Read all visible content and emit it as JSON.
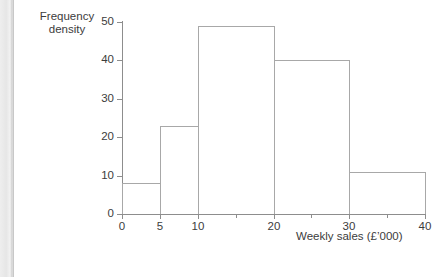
{
  "page": {
    "background_color": "#ffffff",
    "edge_strip_color": "#e6e6e6"
  },
  "chart_data": {
    "type": "bar",
    "subtype": "histogram",
    "title": "",
    "xlabel": "Weekly sales (£’000)",
    "ylabel": "Frequency density",
    "ylabel_lines": [
      "Frequency",
      "density"
    ],
    "xlim": [
      0,
      40
    ],
    "ylim": [
      0,
      50
    ],
    "grid": false,
    "legend": null,
    "axis_color": "#8d8d8d",
    "bar_edge_color": "#a8a8a8",
    "bar_fill_color": "none",
    "xticks": [
      0,
      5,
      10,
      20,
      30,
      40
    ],
    "xtick_labels": [
      "0",
      "5",
      "10",
      "20",
      "30",
      "40"
    ],
    "xticks_minor": [
      15,
      25,
      35
    ],
    "yticks": [
      0,
      10,
      20,
      30,
      40,
      50
    ],
    "ytick_labels": [
      "0",
      "10",
      "20",
      "30",
      "40",
      "50"
    ],
    "bins": [
      {
        "label": "0–5",
        "x_start": 0,
        "x_end": 5,
        "value": 8,
        "width": 5,
        "frequency": 40
      },
      {
        "label": "5–10",
        "x_start": 5,
        "x_end": 10,
        "value": 23,
        "width": 5,
        "frequency": 115
      },
      {
        "label": "10–20",
        "x_start": 10,
        "x_end": 20,
        "value": 49,
        "width": 10,
        "frequency": 490
      },
      {
        "label": "20–30",
        "x_start": 20,
        "x_end": 30,
        "value": 40,
        "width": 10,
        "frequency": 400
      },
      {
        "label": "30–40",
        "x_start": 30,
        "x_end": 40,
        "value": 11,
        "width": 10,
        "frequency": 110
      }
    ],
    "categories": [
      "0–5",
      "5–10",
      "10–20",
      "20–30",
      "30–40"
    ],
    "values": [
      8,
      23,
      49,
      40,
      11
    ]
  }
}
